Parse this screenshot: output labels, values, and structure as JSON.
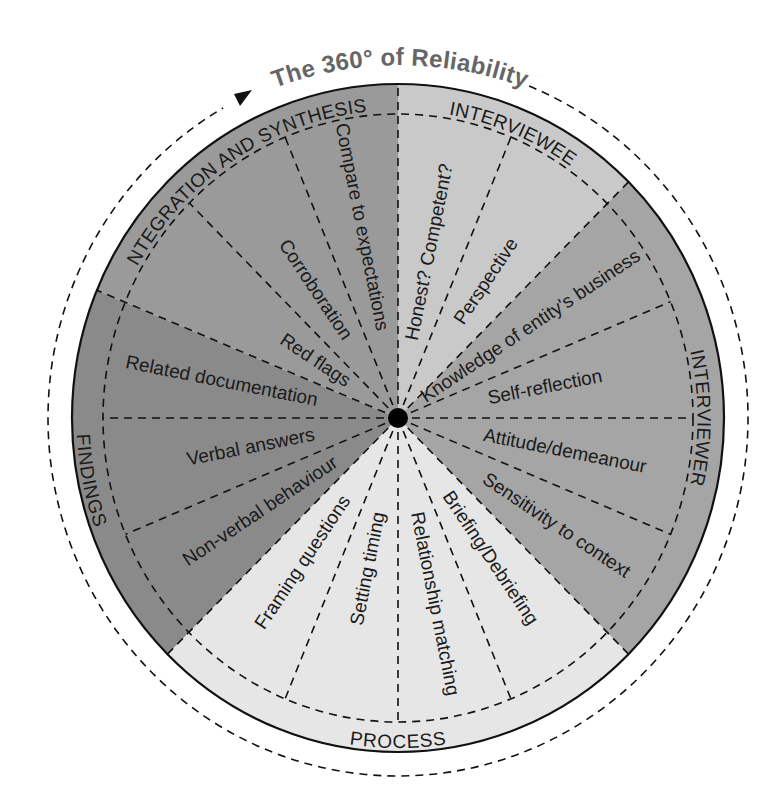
{
  "title": "The 360° of Reliability",
  "geometry": {
    "cx": 398,
    "cy": 418,
    "rx": 326,
    "ry": 334,
    "inner_rx": 295,
    "inner_ry": 304,
    "outer_rx": 350,
    "outer_ry": 358
  },
  "sections": [
    {
      "name": "INTERVIEWEE",
      "start": 0,
      "end": 45,
      "color": "#c9c9c9",
      "items": [
        {
          "label": "Honest? Competent?",
          "angle": 11.25,
          "r": 165
        },
        {
          "label": "Perspective",
          "angle": 33.75,
          "r": 160
        }
      ],
      "dividers": [
        22.5
      ]
    },
    {
      "name": "INTERVIEWER",
      "start": 45,
      "end": 135,
      "color": "#a5a5a5",
      "items": [
        {
          "label": "Knowledge of entity's business",
          "angle": 56.25,
          "r": 160
        },
        {
          "label": "Self-reflection",
          "angle": 78.75,
          "r": 150
        },
        {
          "label": "Attitude/demeanour",
          "angle": 101.25,
          "r": 170
        },
        {
          "label": "Sensitivity to context",
          "angle": 123.75,
          "r": 190
        }
      ],
      "dividers": [
        67.5,
        90,
        112.5
      ]
    },
    {
      "name": "PROCESS",
      "start": 135,
      "end": 225,
      "color": "#e6e6e6",
      "items": [
        {
          "label": "Briefing/Debriefing",
          "angle": 146.25,
          "r": 165
        },
        {
          "label": "Relationship matching",
          "angle": 168.75,
          "r": 185
        },
        {
          "label": "Setting timing",
          "angle": 191.25,
          "r": 150
        },
        {
          "label": "Framing questions",
          "angle": 213.75,
          "r": 170
        }
      ],
      "dividers": [
        157.5,
        180,
        202.5
      ]
    },
    {
      "name": "FINDINGS",
      "start": 225,
      "end": 292.5,
      "color": "#8a8a8a",
      "items": [
        {
          "label": "Non-verbal behaviour",
          "angle": 236.25,
          "r": 165
        },
        {
          "label": "Verbal answers",
          "angle": 258.75,
          "r": 150
        },
        {
          "label": "Related documentation",
          "angle": 281.25,
          "r": 180
        }
      ],
      "dividers": [
        247.5,
        270
      ]
    },
    {
      "name": "INTEGRATION AND SYNTHESIS",
      "start": 292.5,
      "end": 360,
      "color": "#9a9a9a",
      "items": [
        {
          "label": "Red flags",
          "angle": 303.75,
          "r": 100
        },
        {
          "label": "Corroboration",
          "angle": 326.25,
          "r": 150
        },
        {
          "label": "Compare to expectations",
          "angle": 348.75,
          "r": 190
        }
      ],
      "dividers": [
        315,
        337.5
      ]
    }
  ]
}
